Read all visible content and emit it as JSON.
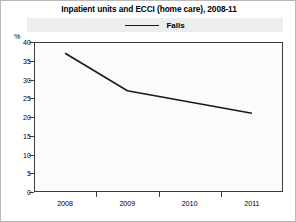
{
  "chart_data": {
    "type": "line",
    "title": "Inpatient units and ECCI (home care), 2008-11",
    "xlabel": "",
    "ylabel": "%",
    "categories": [
      "2008",
      "2009",
      "2010",
      "2011"
    ],
    "x": [
      2008,
      2009,
      2010,
      2011
    ],
    "series": [
      {
        "name": "Falls",
        "values": [
          37,
          27,
          24,
          21
        ],
        "color": "#1a1a1a"
      }
    ],
    "ylim": [
      0,
      40
    ],
    "yticks": [
      0,
      5,
      10,
      15,
      20,
      25,
      30,
      35,
      40
    ],
    "ytick_labels": [
      "0",
      "5",
      "10",
      "15",
      "20",
      "25",
      "30",
      "35",
      "40"
    ],
    "grid": false,
    "legend_position": "top",
    "legend": [
      "Falls"
    ],
    "plot_background": "#fbfbfb",
    "legend_background": "#eceded",
    "axis_color": "#3d3d3d"
  }
}
